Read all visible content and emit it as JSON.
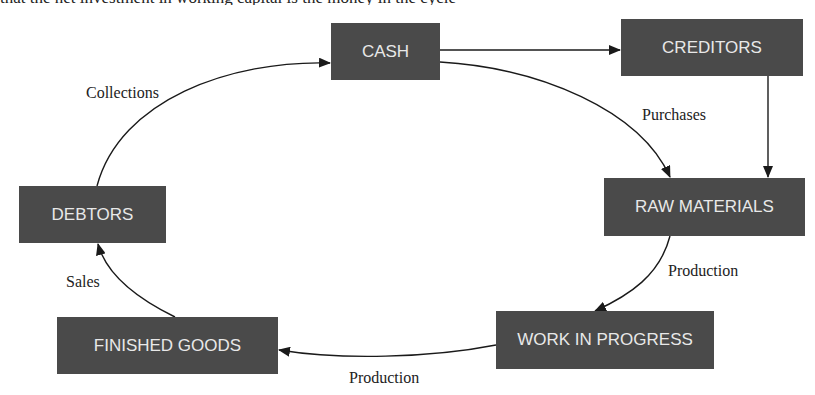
{
  "top_text_cropped": "that the net investment in working capital is the money in the cycle",
  "nodes": {
    "cash": "CASH",
    "creditors": "CREDITORS",
    "raw_materials": "RAW MATERIALS",
    "work_in_progress": "WORK IN PROGRESS",
    "finished_goods": "FINISHED GOODS",
    "debtors": "DEBTORS"
  },
  "edge_labels": {
    "collections": "Collections",
    "purchases": "Purchases",
    "production_1": "Production",
    "production_2": "Production",
    "sales": "Sales"
  },
  "edges": [
    {
      "from": "CASH",
      "to": "CREDITORS",
      "label": ""
    },
    {
      "from": "CREDITORS",
      "to": "RAW MATERIALS",
      "label": ""
    },
    {
      "from": "CASH",
      "to": "RAW MATERIALS",
      "label": "Purchases"
    },
    {
      "from": "RAW MATERIALS",
      "to": "WORK IN PROGRESS",
      "label": "Production"
    },
    {
      "from": "WORK IN PROGRESS",
      "to": "FINISHED GOODS",
      "label": "Production"
    },
    {
      "from": "FINISHED GOODS",
      "to": "DEBTORS",
      "label": "Sales"
    },
    {
      "from": "DEBTORS",
      "to": "CASH",
      "label": "Collections"
    }
  ],
  "colors": {
    "node_fill": "#4a4a4a",
    "node_text": "#e8e8e8",
    "edge": "#1a1a1a"
  }
}
